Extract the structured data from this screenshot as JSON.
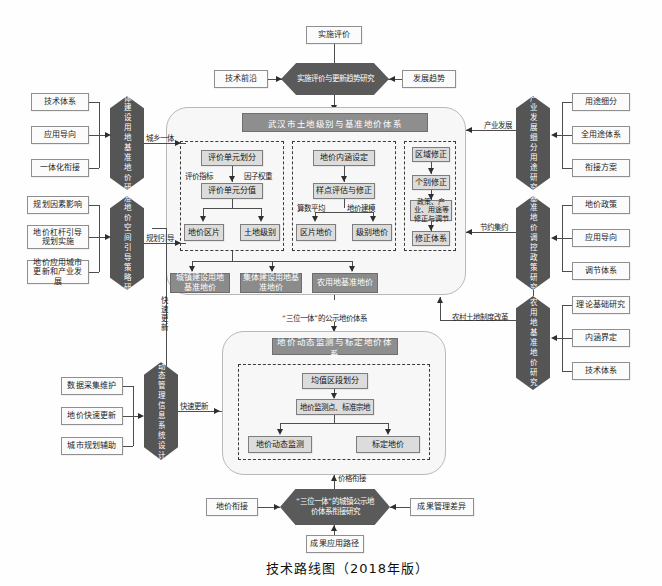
{
  "figure": {
    "caption": "技术路线图（2018年版）"
  },
  "top": {
    "eval_box": "实施评价",
    "left_box": "技术前沿",
    "right_box": "发展趋势",
    "hex": "实施评价与更新趋势研究"
  },
  "main_system": {
    "title": "武汉市土地级别与基准地价体系",
    "group_left": {
      "nodes": [
        "评价单元划分",
        "评价单元分值",
        "地价区片",
        "土地级别"
      ],
      "edge_labels": [
        "评价指标",
        "因子权重"
      ]
    },
    "group_mid": {
      "nodes": [
        "地价内涵设定",
        "样点评估与修正",
        "区片地价",
        "级别地价"
      ],
      "edge_labels": [
        "算数平均",
        "地价建模"
      ]
    },
    "group_right": {
      "nodes": [
        "区域修正",
        "个别修正",
        "政策、产业、用途等修正与调节",
        "修正体系"
      ]
    },
    "outputs": [
      "城镇建设用地基准地价",
      "集体建设用地基准地价",
      "农用地基准地价"
    ]
  },
  "left_column": {
    "hex_top": "集体建设用地基准地价研究",
    "hex_top_items": [
      "技术体系",
      "应用导向",
      "一体化衔接"
    ],
    "hex_mid": "基准地价空间引导策略研究",
    "hex_mid_items": [
      "规划因素影响",
      "地价杠杆引导规划实施",
      "地价应用城市更新和产业发展"
    ],
    "hex_bottom": "地价动态管理信息系统设计研究",
    "hex_bottom_items": [
      "数据采集维护",
      "地价快速更新",
      "城市规划辅助"
    ]
  },
  "right_column": {
    "hex_top": "产业发展细分用途研究",
    "hex_top_items": [
      "用途细分",
      "全用途体系",
      "衔接方案"
    ],
    "hex_mid": "基准地价调控政策研究",
    "hex_mid_items": [
      "地价政策",
      "应用导向",
      "调节体系"
    ],
    "hex_bottom": "农用地基准地价研究",
    "hex_bottom_items": [
      "理论基础研究",
      "内涵界定",
      "技术体系"
    ]
  },
  "monitor_system": {
    "title": "地价动态监测与标定地价体系",
    "nodes": [
      "均值区段划分",
      "地价监测点、标准宗地",
      "地价动态监测",
      "标定地价"
    ]
  },
  "bottom": {
    "hex": "“三位一体”的城镇公示地价体系衔接研究",
    "left_box": "地价衔接",
    "right_box": "成果管理差异",
    "below_box": "成果应用路径"
  },
  "edge_labels": {
    "urban_rural": "城乡一体",
    "planning_guide": "规划引导",
    "fast_update": "快速更新",
    "fast_update2": "快速更新",
    "industry_dev": "产业发展",
    "intensive": "节约集约",
    "rural_land_reform": "农村土地制度改革",
    "three_in_one": "“三位一体”的公示地价体系",
    "price_link": "价格衔接"
  },
  "colors": {
    "dark_fill": "#555555",
    "grey_fill": "#dcdcdc",
    "title_fill": "#8e8e8e",
    "line": "#4d4d4d"
  }
}
